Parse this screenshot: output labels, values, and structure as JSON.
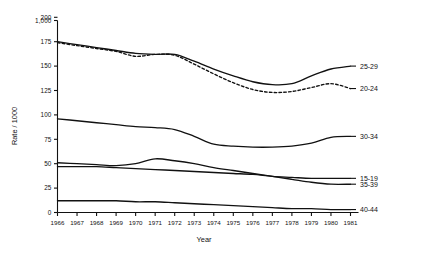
{
  "chart_data": {
    "type": "line",
    "title": "",
    "xlabel": "Year",
    "ylabel": "Rate / 1000",
    "grid": false,
    "legend_position": "right-inline",
    "xlim": [
      1966,
      1981
    ],
    "ylim": [
      0,
      200
    ],
    "yticks": [
      "0",
      "25",
      "50",
      "75",
      "100",
      "125",
      "150",
      "175",
      "200",
      "1,000"
    ],
    "ytick_values": [
      0,
      25,
      50,
      75,
      100,
      125,
      150,
      175,
      200,
      1000
    ],
    "axis_break": {
      "between": [
        200,
        1000
      ],
      "note": "y-axis broken above 200"
    },
    "x": [
      1966,
      1967,
      1968,
      1969,
      1970,
      1971,
      1972,
      1973,
      1974,
      1975,
      1976,
      1977,
      1978,
      1979,
      1980,
      1981
    ],
    "xticklabels": [
      "1966",
      "1967",
      "1968",
      "1969",
      "1970",
      "1971",
      "1972",
      "1973",
      "1974",
      "1975",
      "1976",
      "1977",
      "1978",
      "1979",
      "1980",
      "1981"
    ],
    "series": [
      {
        "name": "25-29",
        "label": "25-29",
        "style": "solid",
        "color": "#111111",
        "values": [
          175,
          172,
          169,
          166,
          163,
          162,
          162,
          155,
          147,
          140,
          134,
          131,
          132,
          140,
          147,
          150
        ]
      },
      {
        "name": "20-24",
        "label": "20-24",
        "style": "dashed",
        "color": "#111111",
        "values": [
          174,
          171,
          168,
          165,
          160,
          162,
          161,
          152,
          142,
          133,
          126,
          123,
          124,
          128,
          132,
          127
        ]
      },
      {
        "name": "30-34",
        "label": "30-34",
        "style": "solid",
        "color": "#111111",
        "values": [
          96,
          94,
          92,
          90,
          88,
          87,
          85,
          78,
          70,
          68,
          67,
          67,
          68,
          71,
          77,
          78
        ]
      },
      {
        "name": "15-19",
        "label": "15-19",
        "style": "solid",
        "color": "#111111",
        "values": [
          47,
          47,
          47,
          46,
          45,
          44,
          43,
          42,
          41,
          40,
          39,
          37,
          36,
          35,
          35,
          35
        ]
      },
      {
        "name": "35-39",
        "label": "35-39",
        "style": "solid",
        "color": "#111111",
        "values": [
          51,
          50,
          49,
          48,
          50,
          55,
          53,
          50,
          46,
          43,
          40,
          37,
          34,
          31,
          29,
          29
        ]
      },
      {
        "name": "40-44",
        "label": "40-44",
        "style": "solid",
        "color": "#111111",
        "values": [
          12,
          12,
          12,
          12,
          11,
          11,
          10,
          9,
          8,
          7,
          6,
          5,
          4,
          4,
          3,
          3
        ]
      }
    ]
  }
}
